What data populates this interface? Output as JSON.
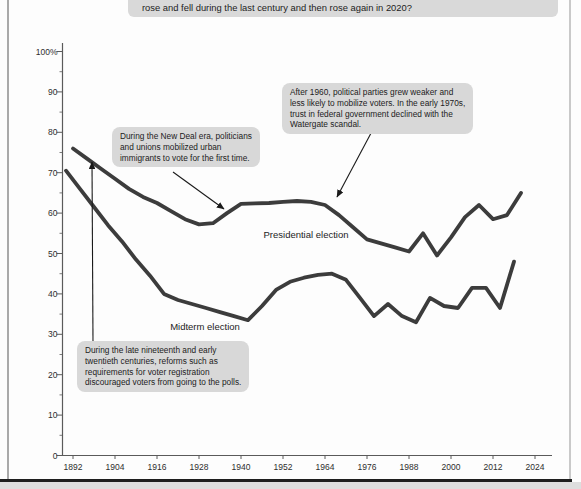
{
  "question": {
    "visible_text": "rose and fell during the last century and then rose again in 2020?"
  },
  "chart_data": {
    "type": "line",
    "xlim": [
      1890,
      2026
    ],
    "ylim": [
      0,
      100
    ],
    "grid": false,
    "legend": "inline-labels",
    "y_tick_labels": [
      "100%",
      "90",
      "80",
      "70",
      "60",
      "50",
      "40",
      "30",
      "20",
      "10",
      "0"
    ],
    "x_tick_labels": [
      "1892",
      "1904",
      "1916",
      "1928",
      "1940",
      "1952",
      "1964",
      "1976",
      "1988",
      "2000",
      "2012",
      "2024"
    ],
    "series": [
      {
        "name": "Presidential election",
        "points": [
          [
            1892,
            76
          ],
          [
            1896,
            73.5
          ],
          [
            1900,
            71
          ],
          [
            1904,
            68.5
          ],
          [
            1908,
            66
          ],
          [
            1912,
            64
          ],
          [
            1916,
            62.5
          ],
          [
            1920,
            60.5
          ],
          [
            1924,
            58.5
          ],
          [
            1928,
            57.2
          ],
          [
            1932,
            57.5
          ],
          [
            1936,
            60
          ],
          [
            1940,
            62.3
          ],
          [
            1944,
            62.4
          ],
          [
            1948,
            62.5
          ],
          [
            1952,
            62.8
          ],
          [
            1956,
            63
          ],
          [
            1960,
            62.8
          ],
          [
            1964,
            62
          ],
          [
            1968,
            59.5
          ],
          [
            1972,
            56.5
          ],
          [
            1976,
            53.5
          ],
          [
            1980,
            52.5
          ],
          [
            1984,
            51.5
          ],
          [
            1988,
            50.5
          ],
          [
            1992,
            55
          ],
          [
            1996,
            49.5
          ],
          [
            2000,
            54
          ],
          [
            2004,
            59
          ],
          [
            2008,
            62
          ],
          [
            2012,
            58.5
          ],
          [
            2016,
            59.5
          ],
          [
            2020,
            65
          ]
        ]
      },
      {
        "name": "Midterm election",
        "points": [
          [
            1890,
            70.5
          ],
          [
            1894,
            66
          ],
          [
            1898,
            61.5
          ],
          [
            1902,
            57
          ],
          [
            1906,
            53
          ],
          [
            1910,
            48.5
          ],
          [
            1914,
            44.5
          ],
          [
            1918,
            40
          ],
          [
            1922,
            38.5
          ],
          [
            1926,
            37.5
          ],
          [
            1930,
            36.5
          ],
          [
            1934,
            35.5
          ],
          [
            1938,
            34.5
          ],
          [
            1942,
            33.5
          ],
          [
            1946,
            37
          ],
          [
            1950,
            41
          ],
          [
            1954,
            43
          ],
          [
            1958,
            44
          ],
          [
            1962,
            44.7
          ],
          [
            1966,
            45
          ],
          [
            1970,
            43.5
          ],
          [
            1974,
            39
          ],
          [
            1978,
            34.5
          ],
          [
            1982,
            37.5
          ],
          [
            1986,
            34.5
          ],
          [
            1990,
            33
          ],
          [
            1994,
            39
          ],
          [
            1998,
            37
          ],
          [
            2002,
            36.5
          ],
          [
            2006,
            41.5
          ],
          [
            2010,
            41.5
          ],
          [
            2014,
            36.5
          ],
          [
            2018,
            48
          ]
        ]
      }
    ],
    "annotations": [
      {
        "id": "new-deal",
        "lines": [
          "During the New Deal era, politicians",
          "and unions mobilized urban",
          "immigrants to vote for the first time."
        ],
        "text": "During the New Deal era, politicians and unions mobilized urban immigrants to vote for the first time."
      },
      {
        "id": "parties-weaken-watergate",
        "lines": [
          "After 1960, political parties grew weaker and",
          "less likely to mobilize voters. In the early 1970s,",
          "trust in federal government declined with the",
          "Watergate scandal."
        ],
        "text": "After 1960, political parties grew weaker and less likely to mobilize voters. In the early 1970s, trust in federal government declined with the Watergate scandal."
      },
      {
        "id": "registration-reforms",
        "lines": [
          "During the late nineteenth and early",
          "twentieth centuries, reforms such as",
          "requirements for voter registration",
          "discouraged voters from going to the polls."
        ],
        "text": "During the late nineteenth and early twentieth centuries, reforms such as requirements for voter registration discouraged voters from going to the polls."
      }
    ]
  },
  "colors": {
    "series_line": "#3c3c3c",
    "axis": "#5a5a5a",
    "tick_text": "#2e2e2e",
    "callout_bg": "#d8d8d8",
    "arrow": "#1a1a1a"
  }
}
